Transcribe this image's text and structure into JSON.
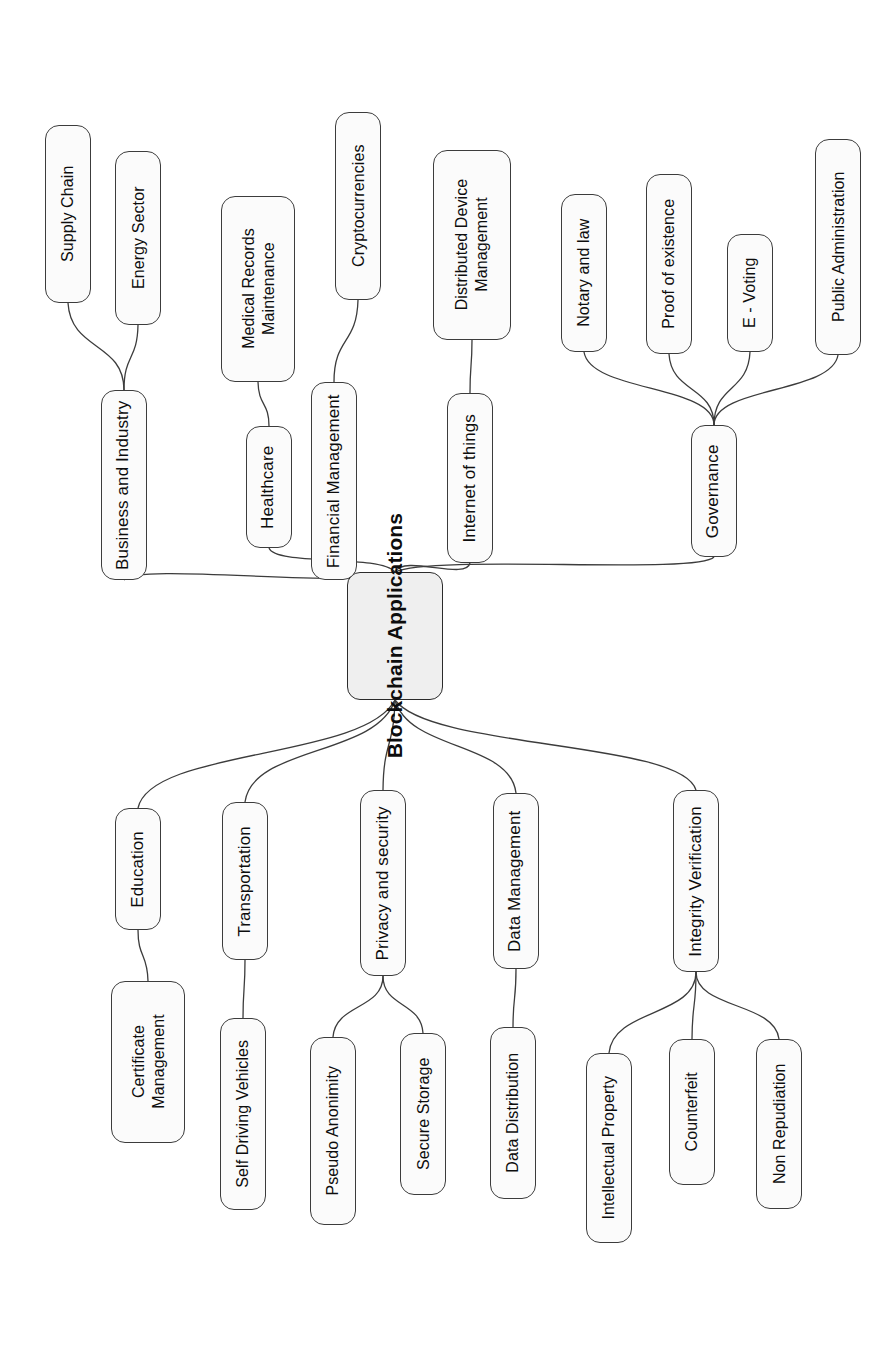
{
  "diagram": {
    "title": "Blockchain Applications",
    "type": "mind-map",
    "orientation": "rotated-90-ccw",
    "colors": {
      "node_fill": "#fbfbfb",
      "root_fill": "#efefef",
      "stroke": "#3c3c3c",
      "text": "#0d0d0d",
      "background": "#ffffff"
    },
    "root": {
      "label": "Blockchain Applications",
      "cx": 395,
      "cy": 636,
      "w": 96,
      "h": 128
    },
    "branches": [
      {
        "label": "Business and Industry",
        "cx": 124,
        "cy": 485,
        "w": 46,
        "h": 190,
        "children": [
          {
            "label": "Supply Chain",
            "cx": 68,
            "cy": 214,
            "w": 46,
            "h": 178
          },
          {
            "label": "Energy Sector",
            "cx": 138,
            "cy": 238,
            "w": 46,
            "h": 174
          }
        ]
      },
      {
        "label": "Healthcare",
        "cx": 269,
        "cy": 487,
        "w": 46,
        "h": 122,
        "children": [
          {
            "label": "Medical Records\nMaintenance",
            "cx": 258,
            "cy": 289,
            "w": 74,
            "h": 186
          }
        ]
      },
      {
        "label": "Financial Management",
        "cx": 334,
        "cy": 481,
        "w": 46,
        "h": 198,
        "children": [
          {
            "label": "Cryptocurrencies",
            "cx": 358,
            "cy": 206,
            "w": 46,
            "h": 188
          }
        ]
      },
      {
        "label": "Internet of things",
        "cx": 470,
        "cy": 478,
        "w": 46,
        "h": 170,
        "children": [
          {
            "label": "Distributed Device\nManagement",
            "cx": 472,
            "cy": 245,
            "w": 78,
            "h": 190
          }
        ]
      },
      {
        "label": "Governance",
        "cx": 714,
        "cy": 491,
        "w": 46,
        "h": 132,
        "children": [
          {
            "label": "Notary and law",
            "cx": 584,
            "cy": 273,
            "w": 46,
            "h": 158
          },
          {
            "label": "Proof of existence",
            "cx": 669,
            "cy": 264,
            "w": 46,
            "h": 180
          },
          {
            "label": "E - Voting",
            "cx": 750,
            "cy": 293,
            "w": 46,
            "h": 118
          },
          {
            "label": "Public Administration",
            "cx": 838,
            "cy": 247,
            "w": 46,
            "h": 216
          }
        ]
      },
      {
        "label": "Education",
        "cx": 138,
        "cy": 869,
        "w": 46,
        "h": 122,
        "children": [
          {
            "label": "Certificate\nManagement",
            "cx": 148,
            "cy": 1062,
            "w": 74,
            "h": 162
          }
        ]
      },
      {
        "label": "Transportation",
        "cx": 245,
        "cy": 881,
        "w": 46,
        "h": 158,
        "children": [
          {
            "label": "Self Driving Vehicles",
            "cx": 243,
            "cy": 1114,
            "w": 46,
            "h": 192
          }
        ]
      },
      {
        "label": "Privacy and security",
        "cx": 383,
        "cy": 883,
        "w": 46,
        "h": 186,
        "children": [
          {
            "label": "Pseudo Anonimity",
            "cx": 333,
            "cy": 1131,
            "w": 46,
            "h": 188
          },
          {
            "label": "Secure Storage",
            "cx": 423,
            "cy": 1114,
            "w": 46,
            "h": 162
          }
        ]
      },
      {
        "label": "Data Management",
        "cx": 516,
        "cy": 881,
        "w": 46,
        "h": 176,
        "children": [
          {
            "label": "Data Distribution",
            "cx": 513,
            "cy": 1113,
            "w": 46,
            "h": 172
          }
        ]
      },
      {
        "label": "Integrity Verification",
        "cx": 696,
        "cy": 881,
        "w": 46,
        "h": 182,
        "children": [
          {
            "label": "Intellectual Property",
            "cx": 609,
            "cy": 1148,
            "w": 46,
            "h": 190
          },
          {
            "label": "Counterfeit",
            "cx": 692,
            "cy": 1112,
            "w": 46,
            "h": 146
          },
          {
            "label": "Non Repudiation",
            "cx": 779,
            "cy": 1124,
            "w": 46,
            "h": 170
          }
        ]
      }
    ],
    "edges": [
      {
        "from": "root",
        "to": "Business and Industry"
      },
      {
        "from": "root",
        "to": "Healthcare"
      },
      {
        "from": "root",
        "to": "Financial Management"
      },
      {
        "from": "root",
        "to": "Internet of things"
      },
      {
        "from": "root",
        "to": "Governance"
      },
      {
        "from": "root",
        "to": "Education"
      },
      {
        "from": "root",
        "to": "Transportation"
      },
      {
        "from": "root",
        "to": "Privacy and security"
      },
      {
        "from": "root",
        "to": "Data Management"
      },
      {
        "from": "root",
        "to": "Integrity Verification"
      },
      {
        "from": "Business and Industry",
        "to": "Supply Chain"
      },
      {
        "from": "Business and Industry",
        "to": "Energy Sector"
      },
      {
        "from": "Healthcare",
        "to": "Medical Records Maintenance"
      },
      {
        "from": "Financial Management",
        "to": "Cryptocurrencies"
      },
      {
        "from": "Internet of things",
        "to": "Distributed Device Management"
      },
      {
        "from": "Governance",
        "to": "Notary and law"
      },
      {
        "from": "Governance",
        "to": "Proof of existence"
      },
      {
        "from": "Governance",
        "to": "E - Voting"
      },
      {
        "from": "Governance",
        "to": "Public Administration"
      },
      {
        "from": "Education",
        "to": "Certificate Management"
      },
      {
        "from": "Transportation",
        "to": "Self Driving Vehicles"
      },
      {
        "from": "Privacy and security",
        "to": "Pseudo Anonimity"
      },
      {
        "from": "Privacy and security",
        "to": "Secure Storage"
      },
      {
        "from": "Data Management",
        "to": "Data Distribution"
      },
      {
        "from": "Integrity Verification",
        "to": "Intellectual Property"
      },
      {
        "from": "Integrity Verification",
        "to": "Counterfeit"
      },
      {
        "from": "Integrity Verification",
        "to": "Non Repudiation"
      }
    ]
  }
}
